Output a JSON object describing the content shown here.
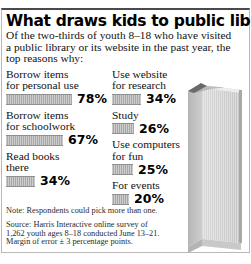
{
  "headline": "What draws kids to public libraries",
  "deck": "Of the two-thirds of youth 8–18 who have visited a public library or its website in the past year, the top reasons why:",
  "note": "Note: Respondents could pick more than one.",
  "source": "Source: Harris Interactive online survey of 1,262 youth ages 8–18 conducted June 13–21. Margin of error ± 3 percentage points.",
  "colors": {
    "bar": "#a8a8a8",
    "bar_edge": "#8f8f8f",
    "text": "#000000",
    "rule": "#4a4a4a",
    "book_light": "#d6d6d6",
    "book_mid": "#c0c0c0",
    "book_dark": "#9a9a9a"
  },
  "art": {
    "name": "standing-book-illustration"
  },
  "chart_data": {
    "type": "bar",
    "title": "What draws kids to public libraries",
    "subtitle": "Of the two-thirds of youth 8–18 who have visited a public library or its website in the past year, the top reasons why:",
    "xlabel": "",
    "ylabel": "",
    "xlim": [
      0,
      100
    ],
    "grid": false,
    "legend": null,
    "orientation": "horizontal",
    "value_suffix": "%",
    "categories": [
      "Borrow items for personal use",
      "Borrow items for schoolwork",
      "Read books there",
      "Use website for research",
      "Study",
      "Use computers for fun",
      "For events"
    ],
    "values": [
      78,
      67,
      34,
      34,
      26,
      25,
      20
    ],
    "annotations": [
      "Note: Respondents could pick more than one.",
      "Source: Harris Interactive online survey of 1,262 youth ages 8–18 conducted June 13–21. Margin of error ± 3 percentage points."
    ]
  },
  "columns": {
    "left": [
      {
        "label_line1": "Borrow items",
        "label_line2": "for personal use",
        "value": 78,
        "value_text": "78%",
        "bar_px": 66
      },
      {
        "label_line1": "Borrow items",
        "label_line2": "for schoolwork",
        "value": 67,
        "value_text": "67%",
        "bar_px": 57
      },
      {
        "label_line1": "Read books",
        "label_line2": "there",
        "value": 34,
        "value_text": "34%",
        "bar_px": 29
      }
    ],
    "right": [
      {
        "label_line1": "Use website",
        "label_line2": "for research",
        "value": 34,
        "value_text": "34%",
        "bar_px": 29
      },
      {
        "label_line1": "Study",
        "label_line2": "",
        "value": 26,
        "value_text": "26%",
        "bar_px": 22
      },
      {
        "label_line1": "Use computers",
        "label_line2": "for fun",
        "value": 25,
        "value_text": "25%",
        "bar_px": 21
      },
      {
        "label_line1": "For events",
        "label_line2": "",
        "value": 20,
        "value_text": "20%",
        "bar_px": 17
      }
    ]
  }
}
